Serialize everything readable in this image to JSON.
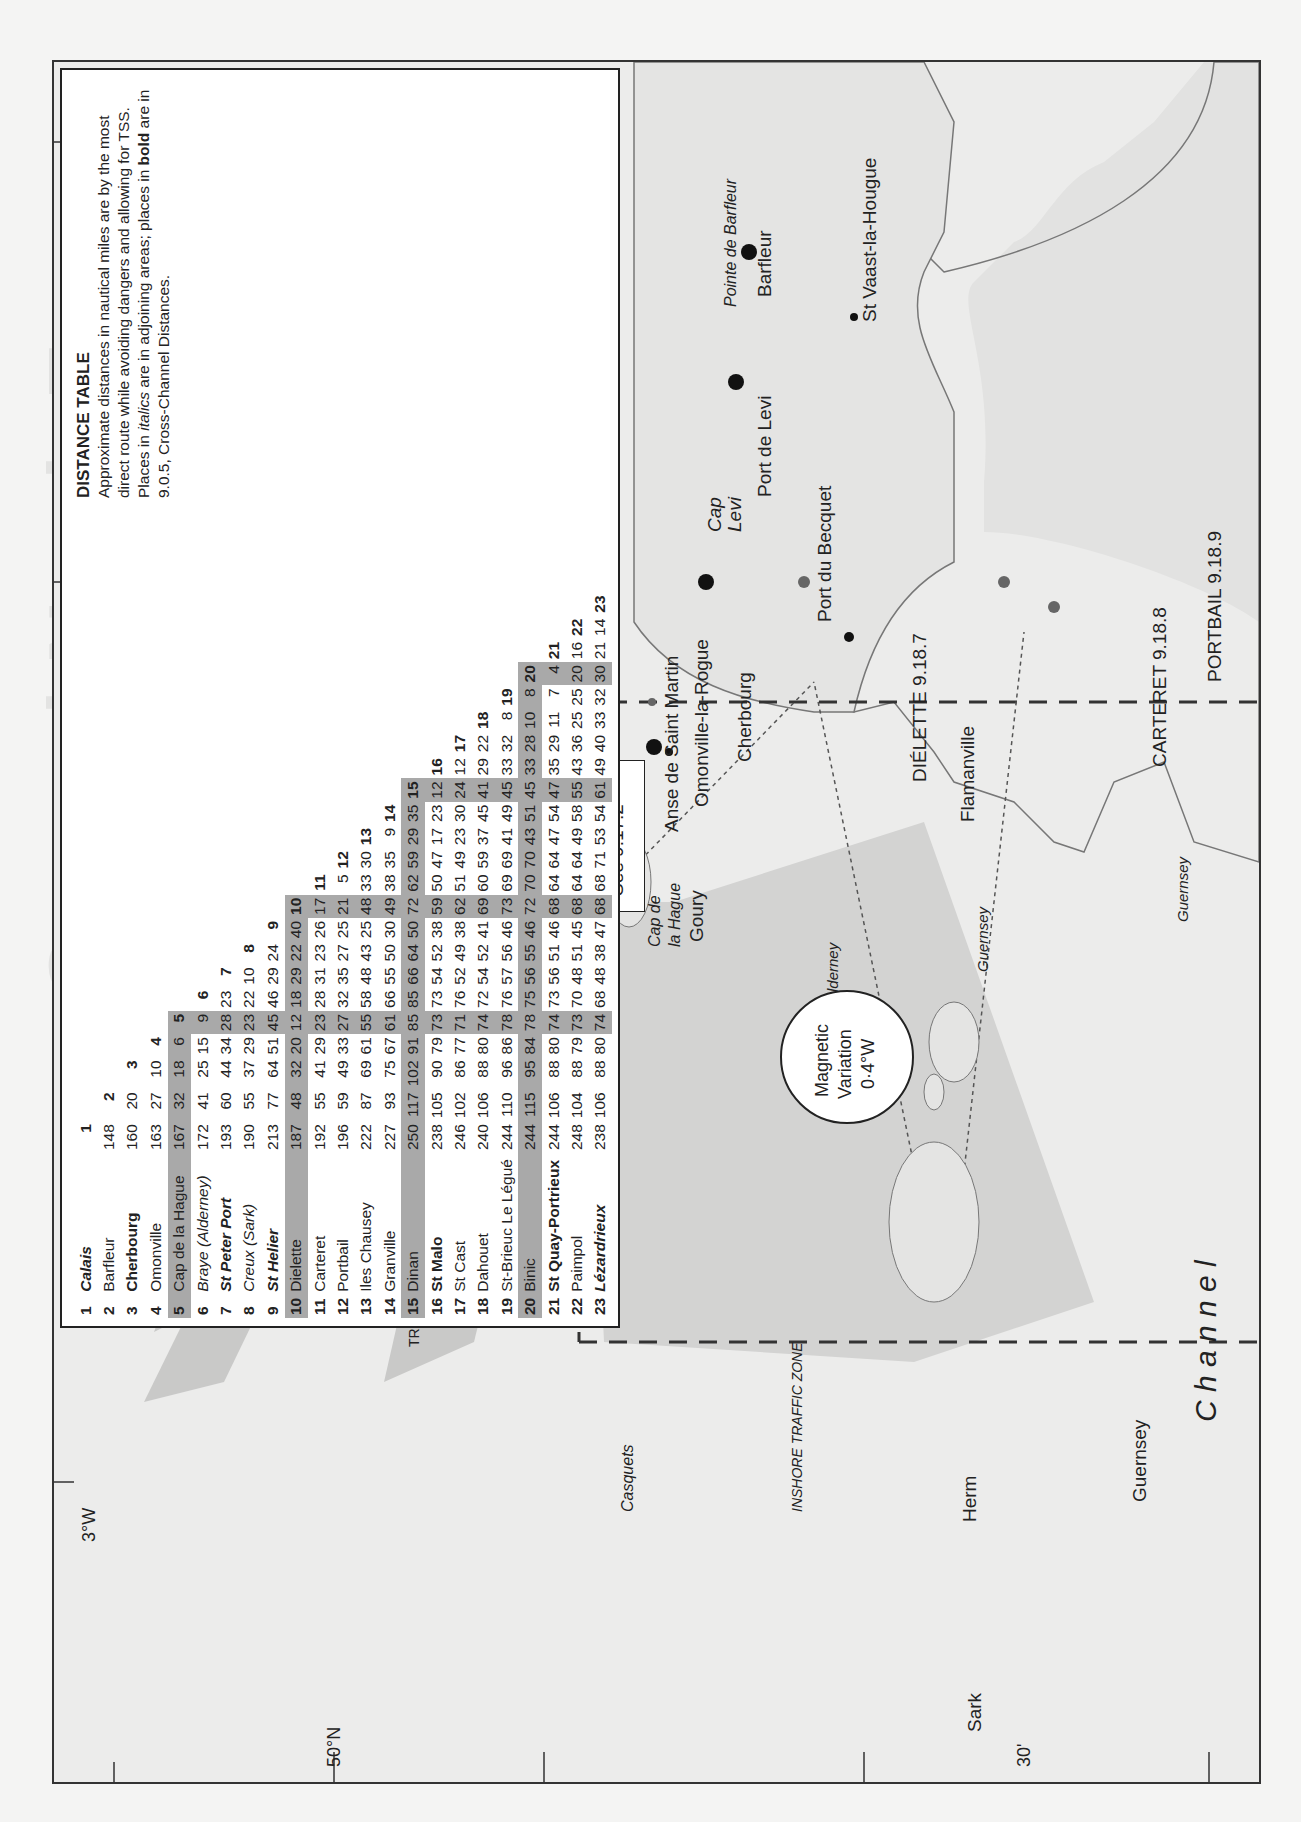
{
  "page": {
    "ghost_title": "Central North France",
    "ghost_subtitle": "Cap de la Hague to St Quay-Portrieux"
  },
  "distance_table": {
    "title": "DISTANCE TABLE",
    "description_parts": [
      "Approximate distances in nautical miles are by the most direct route while avoiding dangers and allowing for TSS. Places in ",
      "italics",
      " are in adjoining areas; places in ",
      "bold",
      " are in 9.0.5, Cross-Channel Distances."
    ],
    "places": [
      {
        "n": "1",
        "name": "Calais",
        "style": "bi",
        "shaded": false
      },
      {
        "n": "2",
        "name": "Barfleur",
        "style": "",
        "shaded": false
      },
      {
        "n": "3",
        "name": "Cherbourg",
        "style": "b",
        "shaded": false
      },
      {
        "n": "4",
        "name": "Omonville",
        "style": "",
        "shaded": false
      },
      {
        "n": "5",
        "name": "Cap de la Hague",
        "style": "",
        "shaded": true
      },
      {
        "n": "6",
        "name": "Braye (Alderney)",
        "style": "i",
        "shaded": false
      },
      {
        "n": "7",
        "name": "St Peter Port",
        "style": "bi",
        "shaded": false
      },
      {
        "n": "8",
        "name": "Creux (Sark)",
        "style": "i",
        "shaded": false
      },
      {
        "n": "9",
        "name": "St Helier",
        "style": "bi",
        "shaded": false
      },
      {
        "n": "10",
        "name": "Dielette",
        "style": "",
        "shaded": true
      },
      {
        "n": "11",
        "name": "Carteret",
        "style": "",
        "shaded": false
      },
      {
        "n": "12",
        "name": "Portbail",
        "style": "",
        "shaded": false
      },
      {
        "n": "13",
        "name": "Iles Chausey",
        "style": "",
        "shaded": false
      },
      {
        "n": "14",
        "name": "Granville",
        "style": "",
        "shaded": false
      },
      {
        "n": "15",
        "name": "Dinan",
        "style": "",
        "shaded": true
      },
      {
        "n": "16",
        "name": "St Malo",
        "style": "b",
        "shaded": false
      },
      {
        "n": "17",
        "name": "St Cast",
        "style": "",
        "shaded": false
      },
      {
        "n": "18",
        "name": "Dahouet",
        "style": "",
        "shaded": false
      },
      {
        "n": "19",
        "name": "St-Brieuc Le Légué",
        "style": "",
        "shaded": false
      },
      {
        "n": "20",
        "name": "Binic",
        "style": "",
        "shaded": true
      },
      {
        "n": "21",
        "name": "St Quay-Portrieux",
        "style": "b",
        "shaded": false
      },
      {
        "n": "22",
        "name": "Paimpol",
        "style": "",
        "shaded": false
      },
      {
        "n": "23",
        "name": "Lézardrieux",
        "style": "bi",
        "shaded": false
      }
    ],
    "rows": [
      [],
      [
        "148"
      ],
      [
        "160",
        "20"
      ],
      [
        "163",
        "27",
        "10"
      ],
      [
        "167",
        "32",
        "18",
        "6"
      ],
      [
        "172",
        "41",
        "25",
        "15",
        "9"
      ],
      [
        "193",
        "60",
        "44",
        "34",
        "28",
        "23"
      ],
      [
        "190",
        "55",
        "37",
        "29",
        "23",
        "22",
        "10"
      ],
      [
        "213",
        "77",
        "64",
        "51",
        "45",
        "46",
        "29",
        "24"
      ],
      [
        "187",
        "48",
        "32",
        "20",
        "12",
        "18",
        "29",
        "22",
        "40"
      ],
      [
        "192",
        "55",
        "41",
        "29",
        "23",
        "28",
        "31",
        "23",
        "26",
        "17"
      ],
      [
        "196",
        "59",
        "49",
        "33",
        "27",
        "32",
        "35",
        "27",
        "25",
        "21",
        "5"
      ],
      [
        "222",
        "87",
        "69",
        "61",
        "55",
        "58",
        "48",
        "43",
        "25",
        "48",
        "33",
        "30"
      ],
      [
        "227",
        "93",
        "75",
        "67",
        "61",
        "66",
        "55",
        "50",
        "30",
        "49",
        "38",
        "35",
        "9"
      ],
      [
        "250",
        "117",
        "102",
        "91",
        "85",
        "85",
        "66",
        "64",
        "50",
        "72",
        "62",
        "59",
        "29",
        "35"
      ],
      [
        "238",
        "105",
        "90",
        "79",
        "73",
        "73",
        "54",
        "52",
        "38",
        "59",
        "50",
        "47",
        "17",
        "23",
        "12"
      ],
      [
        "246",
        "102",
        "86",
        "77",
        "71",
        "76",
        "52",
        "49",
        "38",
        "62",
        "51",
        "49",
        "23",
        "30",
        "24",
        "12"
      ],
      [
        "240",
        "106",
        "88",
        "80",
        "74",
        "72",
        "54",
        "52",
        "41",
        "69",
        "60",
        "59",
        "37",
        "45",
        "41",
        "29",
        "22"
      ],
      [
        "244",
        "110",
        "96",
        "86",
        "78",
        "76",
        "57",
        "56",
        "46",
        "73",
        "69",
        "69",
        "41",
        "49",
        "45",
        "33",
        "32",
        "8"
      ],
      [
        "244",
        "115",
        "95",
        "84",
        "78",
        "75",
        "56",
        "55",
        "46",
        "72",
        "70",
        "70",
        "43",
        "51",
        "45",
        "33",
        "28",
        "10",
        "8"
      ],
      [
        "244",
        "106",
        "88",
        "80",
        "74",
        "73",
        "56",
        "51",
        "46",
        "68",
        "64",
        "64",
        "47",
        "54",
        "47",
        "35",
        "29",
        "11",
        "7",
        "4"
      ],
      [
        "248",
        "104",
        "88",
        "79",
        "73",
        "70",
        "48",
        "51",
        "45",
        "68",
        "64",
        "64",
        "49",
        "58",
        "55",
        "43",
        "36",
        "25",
        "25",
        "20",
        "16"
      ],
      [
        "238",
        "106",
        "88",
        "80",
        "74",
        "68",
        "48",
        "38",
        "47",
        "68",
        "68",
        "71",
        "53",
        "54",
        "61",
        "49",
        "40",
        "33",
        "32",
        "30",
        "21",
        "14"
      ]
    ]
  },
  "map": {
    "see_ref": "See 9.17.2",
    "magnetic": {
      "line1": "Magnetic",
      "line2": "Variation",
      "line3": "0·4°W"
    },
    "labels": {
      "pointe_barfleur": "Pointe de Barfleur",
      "barfleur": "Barfleur",
      "st_vaast": "St Vaast-la-Hougue",
      "port_de_levi": "Port de Levi",
      "cap_levi_1": "Cap",
      "cap_levi_2": "Levi",
      "port_du_becquet": "Port du Becquet",
      "cherbourg": "Cherbourg",
      "anse": "Anse de Saint Martin",
      "omonville": "Omonville-la-Rogue",
      "cap_hague_1": "Cap de",
      "cap_hague_2": "la Hague",
      "goury": "Goury",
      "dielette": "DIÉLETTE 9.18.7",
      "flamanville": "Flamanville",
      "carteret": "CARTERET 9.18.8",
      "portbail": "PORTBAIL 9.18.9",
      "alderney": "Alderney",
      "casquets": "Casquets",
      "herm": "Herm",
      "sark": "Sark",
      "guernsey": "Guernsey",
      "route_alderney": "Alderney",
      "route_guernsey_1": "Guernsey",
      "route_guernsey_2": "Guernsey",
      "inshore": "INSHORE TRAFFIC  ZONE",
      "tss_1": "OFF CASQUETS",
      "tss_2": "TRAFFIC SEPARATION SCHEME",
      "channel": "C h a n n e l"
    },
    "axes": {
      "lon_3w": "3°W",
      "lat_50n": "50°N",
      "min_30_top": "30'",
      "min_30_bottom": "30'"
    }
  }
}
